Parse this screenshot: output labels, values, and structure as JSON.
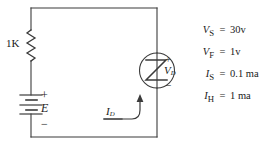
{
  "diagram": {
    "stroke_color": "#3b3b3b",
    "text_color": "#1a1a1a"
  },
  "components": {
    "resistor": {
      "label": "1K",
      "name": "resistor-1k"
    },
    "battery": {
      "plus": "+",
      "symbol": "E",
      "minus": "−",
      "name": "battery-e"
    },
    "diode": {
      "glyph": "Z",
      "plus": "+",
      "minus": "−",
      "voltage_symbol": "V",
      "voltage_subscript": "D",
      "name": "four-layer-diode"
    },
    "current": {
      "symbol": "I",
      "subscript": "D",
      "name": "diode-current"
    }
  },
  "parameters": [
    {
      "symbol": "V",
      "subscript": "S",
      "equals": "=",
      "value": "30v"
    },
    {
      "symbol": "V",
      "subscript": "F",
      "equals": "=",
      "value": "1v"
    },
    {
      "symbol": "I",
      "subscript": "S",
      "equals": "=",
      "value": "0.1 ma"
    },
    {
      "symbol": "I",
      "subscript": "H",
      "equals": "=",
      "value": "1 ma"
    }
  ]
}
